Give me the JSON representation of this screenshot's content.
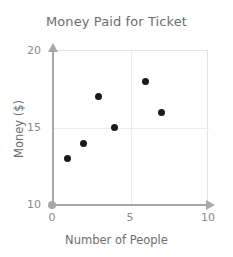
{
  "chart_data": {
    "type": "scatter",
    "title": "Money Paid for Ticket",
    "xlabel": "Number of People",
    "ylabel": "Money ($)",
    "xlim": [
      0,
      10
    ],
    "ylim": [
      10,
      20
    ],
    "xticks": [
      "0",
      "5",
      "10"
    ],
    "xtick_values": [
      0,
      5,
      10
    ],
    "yticks": [
      "10",
      "15",
      "20"
    ],
    "ytick_values": [
      10,
      15,
      20
    ],
    "grid": true,
    "gridlines_x": [
      5
    ],
    "gridlines_y": [
      15
    ],
    "legend": null,
    "legend_position": "none",
    "x": [
      1,
      2,
      3,
      4,
      6,
      7
    ],
    "y": [
      13,
      14,
      17,
      15,
      18,
      16
    ],
    "points": [
      {
        "x": 1,
        "y": 13
      },
      {
        "x": 2,
        "y": 14
      },
      {
        "x": 3,
        "y": 17
      },
      {
        "x": 4,
        "y": 15
      },
      {
        "x": 6,
        "y": 18
      },
      {
        "x": 7,
        "y": 16
      }
    ],
    "marker_color": "#1a1a1a",
    "axis_color": "#a8a8a8",
    "grid_color": "#ececec",
    "text_color": "#6e6e6e"
  }
}
